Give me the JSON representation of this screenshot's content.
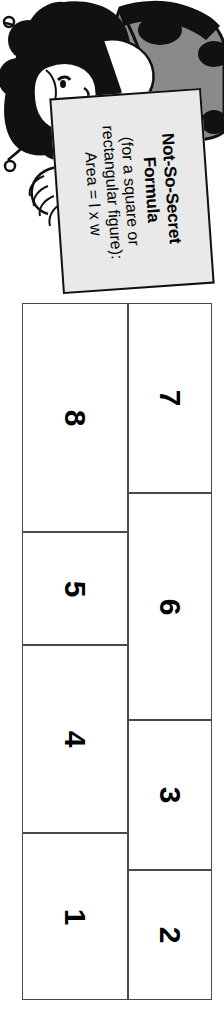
{
  "page": {
    "orientation": "rotated-90-clockwise",
    "background_color": "#ffffff"
  },
  "illustration": {
    "name": "girl-in-ladybug-costume",
    "description": "Cartoon girl with dark curly hair wearing a ladybug costume with antennae, holding up a sign",
    "colors": {
      "ink": "#111111",
      "shell_gray": "#8a8a8a",
      "skin": "#ffffff"
    }
  },
  "sign": {
    "name": "not-so-secret-formula-sign",
    "background_color": "#e9e9e9",
    "border_color": "#111111",
    "line1": "Not-So-Secret",
    "line2": "Formula",
    "line3": "(for a square or",
    "line4": "rectangular figure):",
    "line5": "Area = l x w"
  },
  "grid": {
    "name": "numbered-rectangles-grid",
    "border_color": "#4a4a4a",
    "columns": [
      {
        "name": "top-row-when-upright",
        "cells": [
          {
            "label": "8",
            "x": 0,
            "y": 0,
            "w": 106,
            "h": 229
          },
          {
            "label": "5",
            "x": 0,
            "y": 229,
            "w": 106,
            "h": 113
          },
          {
            "label": "4",
            "x": 0,
            "y": 342,
            "w": 106,
            "h": 188
          },
          {
            "label": "1",
            "x": 0,
            "y": 530,
            "w": 106,
            "h": 167
          }
        ]
      },
      {
        "name": "bottom-row-when-upright",
        "cells": [
          {
            "label": "7",
            "x": 106,
            "y": 0,
            "w": 84,
            "h": 190
          },
          {
            "label": "6",
            "x": 106,
            "y": 190,
            "w": 84,
            "h": 227
          },
          {
            "label": "3",
            "x": 106,
            "y": 417,
            "w": 84,
            "h": 150
          },
          {
            "label": "2",
            "x": 106,
            "y": 567,
            "w": 84,
            "h": 130
          }
        ]
      }
    ]
  }
}
